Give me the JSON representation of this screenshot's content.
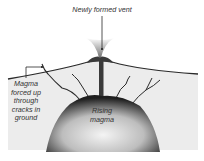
{
  "diagram": {
    "labels": {
      "vent": "Newly formed vent",
      "cracks": [
        "Magma",
        "forced up",
        "through",
        "cracks in",
        "ground"
      ],
      "core": [
        "Rising",
        "magma"
      ]
    },
    "colors": {
      "ink": "#2a2a2a",
      "ground_fill": "#e9e9e9",
      "magma_dark": "#1e1e1e",
      "magma_light": "#f2f2f2",
      "background": "#ffffff"
    }
  }
}
